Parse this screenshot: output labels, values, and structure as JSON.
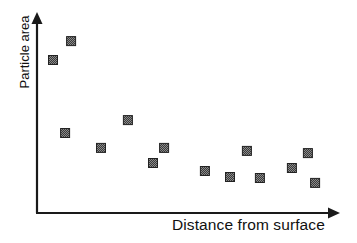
{
  "chart_data": {
    "type": "scatter",
    "title": "",
    "xlabel": "Distance from surface",
    "ylabel": "Particle area",
    "xlim": [
      0,
      100
    ],
    "ylim": [
      0,
      100
    ],
    "grid": false,
    "legend": null,
    "ticks": "none (axes drawn as arrows, no tick labels)",
    "marker": {
      "shape": "square",
      "size_px": 9,
      "fill": "#4a4a4a",
      "pattern": "checkered",
      "border": "#222222"
    },
    "series": [
      {
        "name": "Particles",
        "points": [
          {
            "x": 5.3,
            "y": 76.4
          },
          {
            "x": 11.3,
            "y": 85.9
          },
          {
            "x": 9.3,
            "y": 39.7
          },
          {
            "x": 21.2,
            "y": 32.2
          },
          {
            "x": 30.1,
            "y": 46.2
          },
          {
            "x": 38.4,
            "y": 24.6
          },
          {
            "x": 42.1,
            "y": 32.2
          },
          {
            "x": 55.6,
            "y": 20.6
          },
          {
            "x": 63.9,
            "y": 17.6
          },
          {
            "x": 69.5,
            "y": 30.7
          },
          {
            "x": 73.8,
            "y": 17.1
          },
          {
            "x": 84.4,
            "y": 22.1
          },
          {
            "x": 89.7,
            "y": 29.6
          },
          {
            "x": 92.1,
            "y": 14.6
          }
        ]
      }
    ],
    "annotations": []
  },
  "axes": {
    "x_label": "Distance from surface",
    "y_label": "Particle area",
    "axis_color": "#1a1a1a"
  }
}
